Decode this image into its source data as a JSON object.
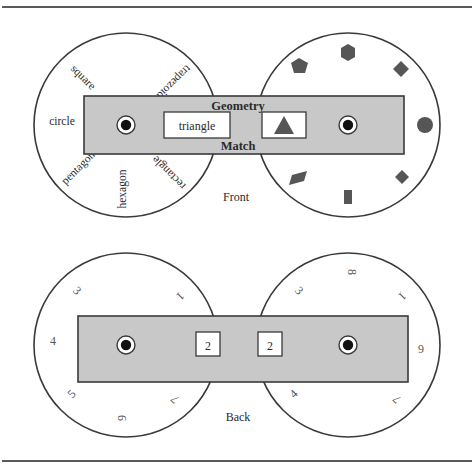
{
  "figure": {
    "title_top_rule": "",
    "title_bottom_rule": "",
    "colors": {
      "band_fill": "#c8c8c8",
      "stroke": "#3a3a3a",
      "shape_fill": "#565656",
      "text": "#2b2b2b",
      "box_fill": "#ffffff",
      "rule": "#5a5a5a"
    }
  },
  "front": {
    "view_label": "Front",
    "band": {
      "top_text": "Geometry",
      "bottom_text": "Match",
      "window_text": "triangle",
      "window_icon": "triangle-icon",
      "left_hub": "hub-left",
      "right_hub": "hub-right"
    },
    "left_wheel": {
      "name": "word-wheel",
      "labels": [
        {
          "text": "hexagon",
          "angle": 180
        },
        {
          "text": "pentagon",
          "angle": 225
        },
        {
          "text": "circle",
          "angle": 270
        },
        {
          "text": "square",
          "angle": 315
        },
        {
          "text": "trapezoid",
          "angle": 45
        },
        {
          "text": "parallelogram",
          "angle": 90
        },
        {
          "text": "rectangle",
          "angle": 135
        }
      ]
    },
    "right_wheel": {
      "name": "shape-wheel",
      "shapes": [
        {
          "icon": "hexagon-icon",
          "angle": 270
        },
        {
          "icon": "pentagon-icon",
          "angle": 225
        },
        {
          "icon": "diamond-icon",
          "angle": 315
        },
        {
          "icon": "circle-icon",
          "angle": 0
        },
        {
          "icon": "square-rotated-icon",
          "angle": 45
        },
        {
          "icon": "parallelogram-icon",
          "angle": 135
        },
        {
          "icon": "rectangle-icon",
          "angle": 90
        }
      ]
    }
  },
  "back": {
    "view_label": "Back",
    "band": {
      "left_window_text": "2",
      "right_window_text": "2",
      "left_hub": "hub-left",
      "right_hub": "hub-right"
    },
    "left_wheel": {
      "name": "number-wheel-left",
      "numbers": [
        {
          "text": "9",
          "angle": 180
        },
        {
          "text": "5",
          "angle": 225
        },
        {
          "text": "4",
          "angle": 270
        },
        {
          "text": "3",
          "angle": 315
        },
        {
          "text": "1",
          "angle": 45
        },
        {
          "text": "8",
          "angle": 90
        },
        {
          "text": "7",
          "angle": 135
        }
      ]
    },
    "right_wheel": {
      "name": "number-wheel-right",
      "numbers": [
        {
          "text": "4",
          "angle": 225
        },
        {
          "text": "5",
          "angle": 270
        },
        {
          "text": "3",
          "angle": 315
        },
        {
          "text": "8",
          "angle": 0
        },
        {
          "text": "1",
          "angle": 45
        },
        {
          "text": "6",
          "angle": 90
        },
        {
          "text": "7",
          "angle": 135
        }
      ]
    }
  }
}
